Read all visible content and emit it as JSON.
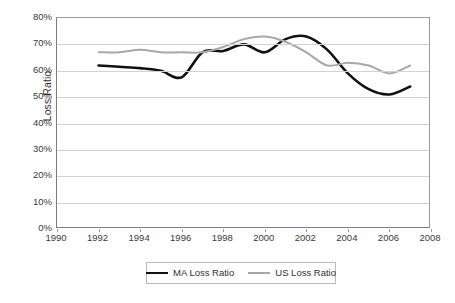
{
  "chart_data": {
    "type": "line",
    "title": "",
    "xlabel": "",
    "ylabel": "Loss Ratio",
    "xlim": [
      1990,
      2008
    ],
    "ylim": [
      0,
      0.8
    ],
    "grid": true,
    "legend_position": "bottom",
    "x_tick_labels": [
      "1990",
      "1992",
      "1994",
      "1996",
      "1998",
      "2000",
      "2002",
      "2004",
      "2006",
      "2008"
    ],
    "x_ticks": [
      1990,
      1992,
      1994,
      1996,
      1998,
      2000,
      2002,
      2004,
      2006,
      2008
    ],
    "y_tick_labels": [
      "80%",
      "70%",
      "60%",
      "50%",
      "40%",
      "30%",
      "20%",
      "10%",
      "0%"
    ],
    "y_ticks": [
      80,
      70,
      60,
      50,
      40,
      30,
      20,
      10,
      0
    ],
    "x": [
      1992,
      1993,
      1994,
      1995,
      1996,
      1997,
      1998,
      1999,
      2000,
      2001,
      2002,
      2003,
      2004,
      2005,
      2006,
      2007
    ],
    "series": [
      {
        "name": "MA Loss Ratio",
        "color": "#111111",
        "width": 2.6,
        "values": [
          62,
          61.5,
          61,
          60,
          57.5,
          67,
          67.5,
          70,
          67,
          72,
          73,
          68,
          59,
          53,
          51,
          54
        ]
      },
      {
        "name": "US Loss Ratio",
        "color": "#a8a8a8",
        "width": 2.0,
        "values": [
          67,
          67,
          68,
          67,
          67,
          67,
          69,
          72,
          73,
          71,
          67,
          62,
          63,
          62,
          59,
          62
        ]
      }
    ]
  },
  "axis": {
    "y_title": "Loss Ratio"
  },
  "legend": {
    "entries": [
      {
        "label": "MA Loss Ratio"
      },
      {
        "label": "US Loss Ratio"
      }
    ]
  },
  "colors": {
    "ma_line": "#111111",
    "us_line": "#a8a8a8",
    "gridline": "#d2d2d2",
    "axis": "#7d7d7d",
    "text": "#2f2f2f",
    "background": "#ffffff"
  }
}
